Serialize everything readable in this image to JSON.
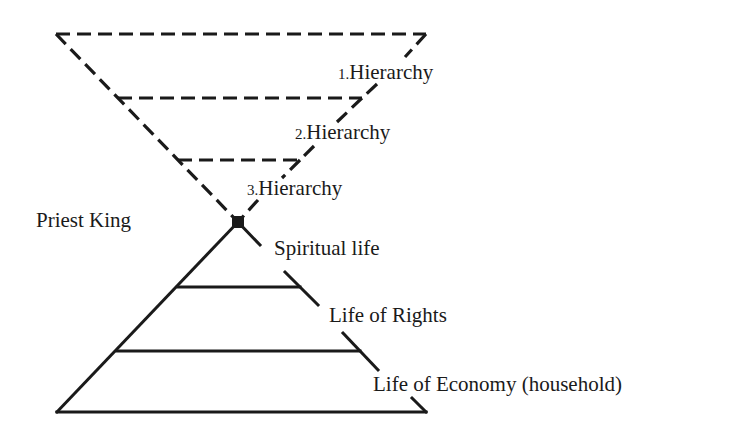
{
  "diagram": {
    "inverted_triangle": {
      "style": "dashed",
      "levels": [
        {
          "number": "1.",
          "label": "Hierarchy"
        },
        {
          "number": "2.",
          "label": "Hierarchy"
        },
        {
          "number": "3.",
          "label": "Hierarchy"
        }
      ]
    },
    "apex_label": "Priest King",
    "pyramid": {
      "style": "solid",
      "levels": [
        {
          "label": "Spiritual life"
        },
        {
          "label": "Life of Rights"
        },
        {
          "label": "Life of Economy (household)"
        }
      ]
    },
    "colors": {
      "line": "#1a1a1a",
      "background": "#ffffff"
    }
  }
}
